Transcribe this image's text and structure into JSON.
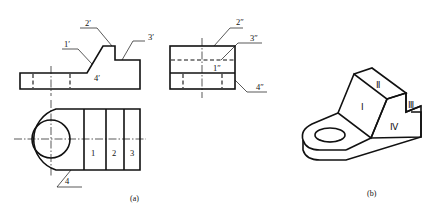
{
  "figure": {
    "subfigures": [
      {
        "id": "a",
        "caption": "(a)",
        "views": {
          "front": {
            "labels": [
              "1′",
              "2′",
              "3′",
              "4′"
            ]
          },
          "side": {
            "labels": [
              "2″",
              "3″",
              "1″",
              "4″"
            ]
          },
          "top": {
            "labels": [
              "1",
              "2",
              "3",
              "4"
            ]
          }
        }
      },
      {
        "id": "b",
        "caption": "(b)",
        "faces": [
          "Ⅰ",
          "Ⅱ",
          "Ⅲ",
          "Ⅳ"
        ]
      }
    ]
  },
  "colors": {
    "line": "#111111",
    "background": "#ffffff"
  }
}
